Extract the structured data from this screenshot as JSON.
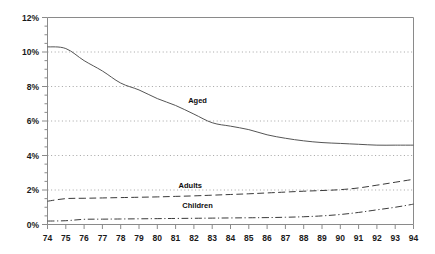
{
  "chart_data": {
    "type": "line",
    "title": "",
    "subtitle": "",
    "xlabel": "",
    "ylabel": "",
    "xlim": [
      74,
      94
    ],
    "ylim": [
      0,
      12
    ],
    "grid": true,
    "grid_axis": "y",
    "legend": "inline-annotations",
    "x": [
      74,
      75,
      76,
      77,
      78,
      79,
      80,
      81,
      82,
      83,
      84,
      85,
      86,
      87,
      88,
      89,
      90,
      91,
      92,
      93,
      94
    ],
    "x_tick_labels": [
      "74",
      "75",
      "76",
      "77",
      "78",
      "79",
      "80",
      "81",
      "82",
      "83",
      "84",
      "85",
      "86",
      "87",
      "88",
      "89",
      "90",
      "91",
      "92",
      "93",
      "94"
    ],
    "y_tick_labels": [
      "0%",
      "2%",
      "4%",
      "6%",
      "8%",
      "10%",
      "12%"
    ],
    "y_ticks": [
      0,
      2,
      4,
      6,
      8,
      10,
      12
    ],
    "series": [
      {
        "name": "Aged",
        "label": "Aged",
        "style": "solid",
        "color": "#555555",
        "label_x": 82.2,
        "label_y": 7.05,
        "values": [
          10.3,
          10.2,
          9.5,
          8.9,
          8.2,
          7.8,
          7.3,
          6.9,
          6.4,
          5.9,
          5.7,
          5.5,
          5.2,
          5.0,
          4.85,
          4.75,
          4.7,
          4.65,
          4.6,
          4.6,
          4.6
        ]
      },
      {
        "name": "Adults",
        "label": "Adults",
        "style": "dashed",
        "color": "#3a3a3a",
        "label_x": 81.8,
        "label_y": 2.12,
        "values": [
          1.35,
          1.5,
          1.52,
          1.54,
          1.56,
          1.58,
          1.6,
          1.63,
          1.66,
          1.7,
          1.74,
          1.78,
          1.83,
          1.88,
          1.93,
          1.97,
          2.02,
          2.12,
          2.28,
          2.45,
          2.62
        ]
      },
      {
        "name": "Children",
        "label": "Children",
        "style": "dashdot",
        "color": "#3a3a3a",
        "label_x": 82.2,
        "label_y": 0.96,
        "values": [
          0.2,
          0.22,
          0.3,
          0.31,
          0.32,
          0.33,
          0.34,
          0.35,
          0.36,
          0.37,
          0.38,
          0.39,
          0.4,
          0.42,
          0.45,
          0.5,
          0.58,
          0.7,
          0.85,
          1.0,
          1.18
        ]
      }
    ],
    "colors": {
      "axis": "#8a8a8a",
      "grid": "#9a9a9a",
      "text": "#1a1a1a",
      "background": "#ffffff"
    }
  }
}
